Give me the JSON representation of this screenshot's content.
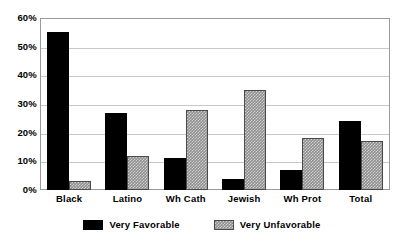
{
  "chart_data": {
    "type": "bar",
    "title": "",
    "subtitle": "",
    "xlabel": "",
    "ylabel": "",
    "ylim": [
      0,
      60
    ],
    "ytick_labels": [
      "60%",
      "50%",
      "40%",
      "30%",
      "20%",
      "10%",
      "0%"
    ],
    "ytick_values": [
      60,
      50,
      40,
      30,
      20,
      10,
      0
    ],
    "grid": true,
    "legend_position": "bottom",
    "categories": [
      "Black",
      "Latino",
      "Wh Cath",
      "Jewish",
      "Wh Prot",
      "Total"
    ],
    "series": [
      {
        "name": "Very Favorable",
        "color": "#000000",
        "values": [
          55,
          27,
          11,
          4,
          7,
          24
        ]
      },
      {
        "name": "Very Unfavorable",
        "color": "#8d8d8d",
        "values": [
          3,
          12,
          28,
          35,
          18,
          17
        ]
      }
    ]
  },
  "legend": {
    "items": [
      {
        "label": "Very Favorable",
        "swatch": "black-swatch"
      },
      {
        "label": "Very Unfavorable",
        "swatch": "gray-hatched-swatch"
      }
    ]
  },
  "colors": {
    "series_favorable": "#000000",
    "series_unfavorable": "#8d8d8d",
    "gridline": "#c8c8c8",
    "frame": "#9a9a9a",
    "background": "#ffffff"
  }
}
